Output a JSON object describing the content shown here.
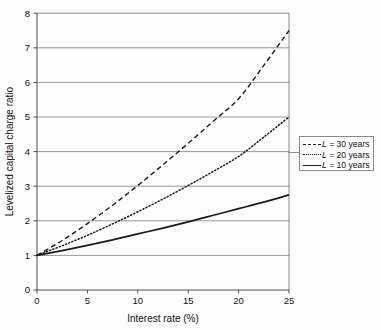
{
  "chart_data": {
    "type": "line",
    "title": "",
    "xlabel": "Interest rate (%)",
    "ylabel": "Levelized capital charge ratio",
    "xlim": [
      0,
      25
    ],
    "ylim": [
      0,
      8
    ],
    "xticks": [
      0,
      5,
      10,
      15,
      20,
      25
    ],
    "yticks": [
      0,
      1,
      2,
      3,
      4,
      5,
      6,
      7,
      8
    ],
    "xtick_labels": [
      "0",
      "5",
      "10",
      "15",
      "20",
      "25"
    ],
    "ytick_labels": [
      "0",
      "1",
      "2",
      "3",
      "4",
      "5",
      "6",
      "7",
      "8"
    ],
    "grid": "horizontal",
    "legend_position": "right-outside",
    "x": [
      0,
      2.5,
      5,
      7.5,
      10,
      12.5,
      15,
      17.5,
      20,
      22.5,
      25
    ],
    "series": [
      {
        "name": "L = 30 years",
        "style": "dashed",
        "values": [
          1.0,
          1.43,
          1.92,
          2.45,
          3.02,
          3.62,
          4.24,
          4.88,
          5.53,
          6.49,
          7.5
        ]
      },
      {
        "name": "L = 20 years",
        "style": "dotted",
        "values": [
          1.0,
          1.28,
          1.58,
          1.91,
          2.26,
          2.63,
          3.02,
          3.43,
          3.86,
          4.42,
          5.0
        ]
      },
      {
        "name": "L = 10 years",
        "style": "solid",
        "values": [
          1.0,
          1.14,
          1.29,
          1.45,
          1.62,
          1.79,
          1.97,
          2.16,
          2.35,
          2.54,
          2.75
        ]
      }
    ]
  },
  "axes": {
    "x_title": "Interest rate (%)",
    "y_title": "Levelized capital charge ratio",
    "x_ticks": [
      "0",
      "5",
      "10",
      "15",
      "20",
      "25"
    ],
    "y_ticks": [
      "8",
      "7",
      "6",
      "5",
      "4",
      "3",
      "2",
      "1",
      "0"
    ]
  },
  "legend": {
    "items": [
      {
        "var": "L",
        "label": " = 30 years",
        "style": "dashed"
      },
      {
        "var": "L",
        "label": " = 20 years",
        "style": "dotted"
      },
      {
        "var": "L",
        "label": " = 10 years",
        "style": "solid"
      }
    ]
  }
}
